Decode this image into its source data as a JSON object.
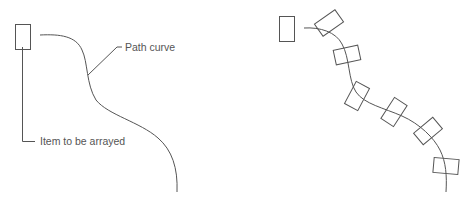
{
  "diagram": {
    "left_panel": {
      "labels": {
        "path_curve": "Path curve",
        "item": "Item to be arrayed"
      },
      "item_rect": {
        "x": 15,
        "y": 24,
        "w": 15,
        "h": 25
      },
      "path_d": "M40,35 C60,34 76,36 82,50 C88,62 86,84 96,100 C108,115 140,122 158,138 C172,150 178,168 177,192"
    },
    "right_panel": {
      "item_rect": {
        "x": 279,
        "y": 16,
        "w": 15,
        "h": 25
      },
      "path_d": "M304,28 C320,27 336,32 342,44 C350,58 348,80 356,92 C364,104 384,108 402,116 C420,124 434,138 440,150 C446,162 447,176 446,192",
      "arrayed_items": [
        {
          "cx": 329,
          "cy": 23,
          "angle": -35
        },
        {
          "cx": 347,
          "cy": 55,
          "angle": -12
        },
        {
          "cx": 357,
          "cy": 96,
          "angle": -62
        },
        {
          "cx": 394,
          "cy": 112,
          "angle": -57
        },
        {
          "cx": 428,
          "cy": 131,
          "angle": -40
        },
        {
          "cx": 446,
          "cy": 166,
          "angle": 5
        }
      ],
      "arrayed_item_size": {
        "w": 25,
        "h": 15
      }
    },
    "colors": {
      "stroke": "#555555",
      "background": "#ffffff"
    }
  }
}
